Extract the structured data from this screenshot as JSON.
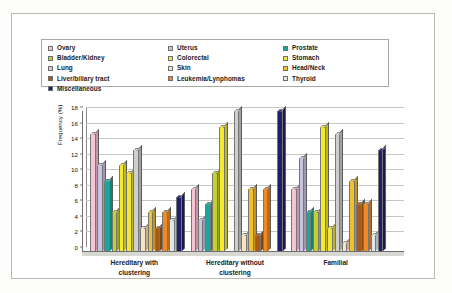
{
  "chart_data": {
    "type": "bar",
    "title": "",
    "xlabel": "",
    "ylabel": "Frequency (%)",
    "ylim": [
      0,
      18
    ],
    "ytick_step": 2,
    "yticks": [
      0,
      2,
      4,
      6,
      8,
      10,
      12,
      14,
      16,
      18
    ],
    "grid": true,
    "legend_position": "top",
    "categories": [
      "Hereditary with\nclustering",
      "Hereditary without\nclustering",
      "Familial"
    ],
    "series": [
      {
        "name": "Ovary",
        "color": "#f6c4d2",
        "values": [
          15,
          8,
          8
        ]
      },
      {
        "name": "Uterus",
        "color": "#c9c2e0",
        "values": [
          11,
          4,
          12
        ]
      },
      {
        "name": "Prostate",
        "color": "#18a79c",
        "values": [
          9,
          6,
          5
        ]
      },
      {
        "name": "Bladder/Kidney",
        "color": "#c3d12b",
        "values": [
          5,
          10,
          5
        ]
      },
      {
        "name": "Colorectal",
        "color": "#f6ea2f",
        "values": [
          11,
          16,
          16
        ]
      },
      {
        "name": "Stomach",
        "color": "#f4e53a",
        "values": [
          10,
          0,
          3
        ]
      },
      {
        "name": "Lung",
        "color": "#cfcfcf",
        "values": [
          13,
          18,
          15
        ]
      },
      {
        "name": "Skin",
        "color": "#f7e4c2",
        "values": [
          3,
          2,
          1
        ]
      },
      {
        "name": "Head/Neck",
        "color": "#f2c02a",
        "values": [
          5,
          8,
          9
        ]
      },
      {
        "name": "Liver/biliary tract",
        "color": "#a85a16",
        "values": [
          3,
          2,
          6
        ]
      },
      {
        "name": "Leukemia/Lynphomas",
        "color": "#f08a22",
        "values": [
          5,
          8,
          6
        ]
      },
      {
        "name": "Thyroid",
        "color": "#dde7f2",
        "values": [
          4,
          0,
          2
        ]
      },
      {
        "name": "Miscellaneous",
        "color": "#1f1f6e",
        "values": [
          7,
          18,
          13
        ]
      }
    ]
  },
  "legend": {
    "columns": [
      [
        {
          "label": "Ovary",
          "color": "#f6c4d2"
        },
        {
          "label": "Bladder/Kidney",
          "color": "#c3d12b"
        },
        {
          "label": "Lung",
          "color": "#cfcfcf"
        },
        {
          "label": "Liver/biliary tract",
          "color": "#a85a16"
        },
        {
          "label": "Miscellaneous",
          "color": "#1f1f6e"
        }
      ],
      [
        {
          "label": "Uterus",
          "color": "#c9c2e0"
        },
        {
          "label": "Colorectal",
          "color": "#f6ea2f"
        },
        {
          "label": "Skin",
          "color": "#f7e4c2"
        },
        {
          "label": "Leukemia/Lynphomas",
          "color": "#f08a22"
        }
      ],
      [
        {
          "label": "Prostate",
          "color": "#18a79c"
        },
        {
          "label": "Stomach",
          "color": "#f4e53a"
        },
        {
          "label": "Head/Neck",
          "color": "#f2c02a"
        },
        {
          "label": "Thyroid",
          "color": "#dde7f2"
        }
      ]
    ]
  }
}
